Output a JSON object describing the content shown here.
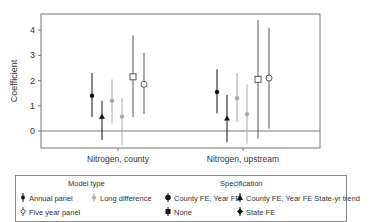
{
  "chart_data": {
    "type": "scatter",
    "subtype": "point-with-error-bars",
    "title": "",
    "xlabel": "",
    "ylabel": "Coefficient",
    "ylim": [
      -0.7,
      4.6
    ],
    "yticks": [
      0,
      1,
      2,
      3,
      4
    ],
    "grid": false,
    "reference_line_y": 0,
    "categories": [
      "Nitrogen, county",
      "Nitrogen, upstream"
    ],
    "legend_position": "bottom",
    "series": [
      {
        "name": "Annual panel / County FE, Year FE",
        "model_type": "Annual panel",
        "specification": "County FE, Year FE",
        "marker": "filled-circle",
        "color": "#111111",
        "values": [
          1.4,
          1.55
        ],
        "lower": [
          0.55,
          0.7
        ],
        "upper": [
          2.3,
          2.45
        ]
      },
      {
        "name": "Annual panel / County FE, Year FE State-yr trend",
        "model_type": "Annual panel",
        "specification": "County FE, Year FE State-yr trend",
        "marker": "filled-triangle",
        "color": "#111111",
        "values": [
          0.57,
          0.5
        ],
        "lower": [
          -0.35,
          -0.45
        ],
        "upper": [
          1.2,
          1.43
        ]
      },
      {
        "name": "Long difference / County FE, Year FE",
        "model_type": "Long difference",
        "specification": "County FE, Year FE",
        "marker": "filled-circle",
        "color": "#aaaaaa",
        "values": [
          1.2,
          1.3
        ],
        "lower": [
          0.3,
          0.35
        ],
        "upper": [
          2.05,
          2.3
        ]
      },
      {
        "name": "Long difference / None",
        "model_type": "Long difference",
        "specification": "None",
        "marker": "filled-circle",
        "color": "#aaaaaa",
        "values": [
          0.57,
          0.67
        ],
        "lower": [
          -0.55,
          -0.5
        ],
        "upper": [
          1.3,
          1.85
        ]
      },
      {
        "name": "Five year panel / County FE, Year FE",
        "model_type": "Five year panel",
        "specification": "County FE, Year FE",
        "marker": "open-square",
        "color": "#555555",
        "values": [
          2.15,
          2.05
        ],
        "lower": [
          0.55,
          -0.3
        ],
        "upper": [
          3.8,
          4.4
        ]
      },
      {
        "name": "Five year panel / State FE",
        "model_type": "Five year panel",
        "specification": "State FE",
        "marker": "open-circle",
        "color": "#555555",
        "values": [
          1.85,
          2.1
        ],
        "lower": [
          0.67,
          0.1
        ],
        "upper": [
          3.1,
          4.1
        ]
      }
    ]
  },
  "legend": {
    "model_type_title": "Model type",
    "specification_title": "Specification",
    "model_types": [
      "Annual panel",
      "Long difference",
      "Five year panel"
    ],
    "specifications": [
      "County FE, Year FE",
      "County FE, Year FE State-yr trend",
      "None",
      "State FE"
    ]
  },
  "axis": {
    "ylabel": "Coefficient",
    "yticks": [
      "0",
      "1",
      "2",
      "3",
      "4"
    ],
    "xticks": [
      "Nitrogen, county",
      "Nitrogen, upstream"
    ]
  }
}
